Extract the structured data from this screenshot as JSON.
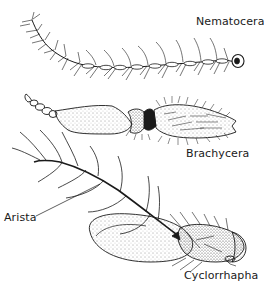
{
  "figure": {
    "type": "anatomical line drawing",
    "stroke_color": "#1a1a1a",
    "background": "#ffffff"
  },
  "labels": {
    "nematocera": "Nematocera",
    "brachycera": "Brachycera",
    "arista": "Arista",
    "cyclorrhapha": "Cyclorrhapha"
  },
  "panels": [
    {
      "name": "Nematocera",
      "description": "long filiform antenna with many whorled-bristled segments"
    },
    {
      "name": "Brachycera",
      "description": "short stout antenna with stippled segments and hairy terminal segment"
    },
    {
      "name": "Cyclorrhapha",
      "description": "oval third segment bearing plumose arista"
    }
  ]
}
